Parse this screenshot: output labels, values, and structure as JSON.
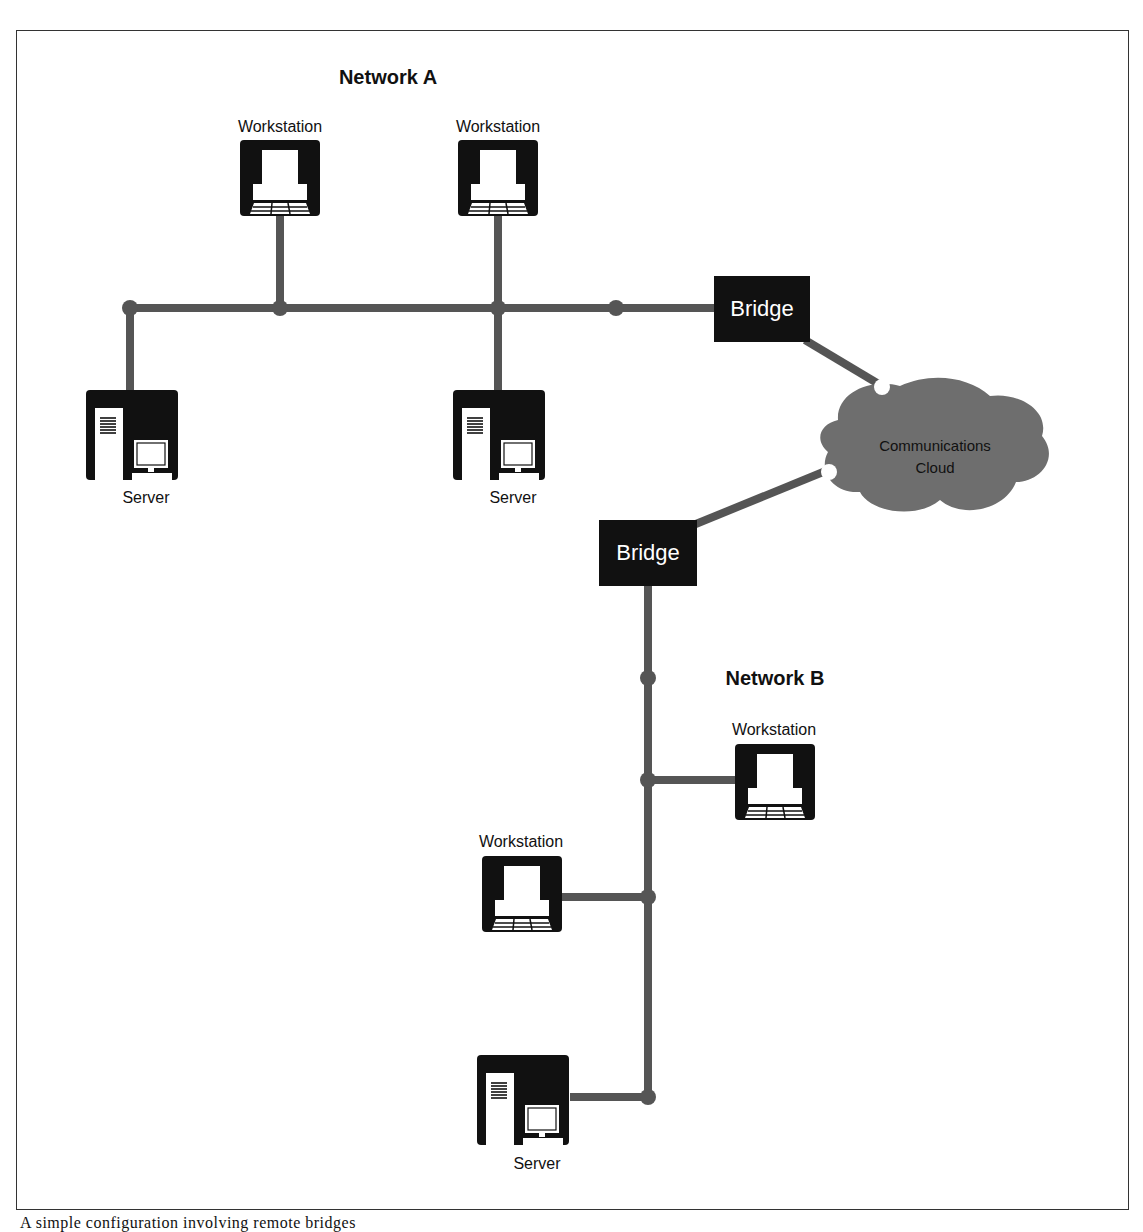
{
  "diagram": {
    "caption": "A simple configuration involving remote bridges",
    "colors": {
      "device": "#111111",
      "link": "#555555",
      "cloud": "#6e6e6e",
      "frame": "#333333"
    },
    "network_a": {
      "title": "Network A",
      "workstations": [
        {
          "label": "Workstation"
        },
        {
          "label": "Workstation"
        }
      ],
      "servers": [
        {
          "label": "Server"
        },
        {
          "label": "Server"
        }
      ],
      "bridge": {
        "label": "Bridge"
      }
    },
    "cloud": {
      "line1": "Communications",
      "line2": "Cloud"
    },
    "network_b": {
      "title": "Network B",
      "bridge": {
        "label": "Bridge"
      },
      "workstations": [
        {
          "label": "Workstation"
        },
        {
          "label": "Workstation"
        }
      ],
      "servers": [
        {
          "label": "Server"
        }
      ]
    }
  }
}
